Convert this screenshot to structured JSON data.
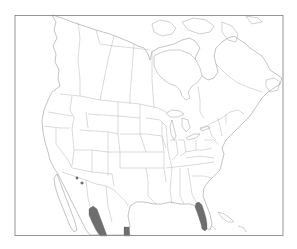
{
  "map": {
    "type": "species range map",
    "region": "North America",
    "background_color": "#ffffff",
    "frame_color": "#8a8a8a",
    "border_color": "#b4b4b4",
    "range_color": "#6e6e6e",
    "range_regions": [
      {
        "name": "peninsular-florida"
      },
      {
        "name": "sierra-madre-occidental-mexico"
      },
      {
        "name": "tamaulipas-mexico"
      },
      {
        "name": "southeast-arizona"
      }
    ]
  }
}
